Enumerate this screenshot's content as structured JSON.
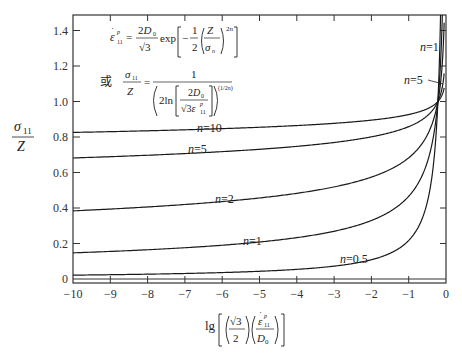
{
  "chart_data": {
    "type": "line",
    "title": "",
    "xlabel": "lg[(√3/2)(ε̇11p/D0)]",
    "ylabel": "σ11/Z",
    "xlim": [
      -10,
      0
    ],
    "ylim": [
      0,
      1.5
    ],
    "grid": false,
    "legend_position": "inline labels on curves",
    "x_ticks": [
      -10,
      -9,
      -8,
      -7,
      -6,
      -5,
      -4,
      -3,
      -2,
      -1,
      0
    ],
    "x_tick_labels": [
      "−10",
      "−9",
      "−8",
      "−7",
      "−6",
      "−5",
      "−4",
      "−3",
      "−2",
      "−1",
      "0"
    ],
    "y_ticks": [
      0,
      0.2,
      0.4,
      0.6,
      0.8,
      1.0,
      1.2,
      1.4
    ],
    "y_tick_labels": [
      "0",
      "0.2",
      "0.4",
      "0.6",
      "0.8",
      "1.0",
      "1.2",
      "1.4"
    ],
    "x": [
      -10,
      -9,
      -8,
      -7,
      -6,
      -5,
      -4,
      -3,
      -2,
      -1,
      -0.5,
      -0.3,
      -0.217,
      -0.15,
      -0.1,
      -0.07
    ],
    "series": [
      {
        "name": "n=10",
        "values": [
          0.826,
          0.83,
          0.835,
          0.84,
          0.846,
          0.853,
          0.862,
          0.875,
          0.893,
          0.926,
          0.961,
          0.987,
          1.0,
          1.019,
          1.04,
          1.059
        ]
      },
      {
        "name": "n=5",
        "values": [
          0.682,
          0.69,
          0.697,
          0.706,
          0.716,
          0.728,
          0.744,
          0.765,
          0.797,
          0.857,
          0.923,
          0.975,
          1.0,
          1.038,
          1.082,
          1.121
        ]
      },
      {
        "name": "n=2",
        "values": [
          0.385,
          0.395,
          0.405,
          0.419,
          0.434,
          0.453,
          0.477,
          0.511,
          0.566,
          0.674,
          0.818,
          0.936,
          1.0,
          1.097,
          1.217,
          1.332
        ]
      },
      {
        "name": "n=1",
        "values": [
          0.147,
          0.156,
          0.165,
          0.176,
          0.19,
          0.208,
          0.233,
          0.269,
          0.329,
          0.466,
          0.659,
          0.877,
          1.0,
          1.203,
          1.481,
          1.773
        ]
      },
      {
        "name": "n=0.5",
        "values": [
          0.022,
          0.024,
          0.027,
          0.031,
          0.036,
          0.043,
          0.054,
          0.072,
          0.109,
          0.217,
          0.434,
          0.724,
          1.0,
          1.447,
          2.171,
          3.101
        ]
      }
    ],
    "annotations": [
      "ε̇11p = (2D0/√3) exp[−(1/2)(Z/σn)^(2n)]",
      "或 σ11/Z = 1 / (2ln[2D0/(√3 ε̇11p)])^(1/2n)"
    ]
  },
  "labels": {
    "n10": "n=10",
    "n5_mid": "n=5",
    "n2": "n=2",
    "n1_mid": "n=1",
    "n05": "n=0.5",
    "n1_right": "n=1",
    "n5_right": "n=5"
  },
  "formula": {
    "or_char": "或"
  }
}
